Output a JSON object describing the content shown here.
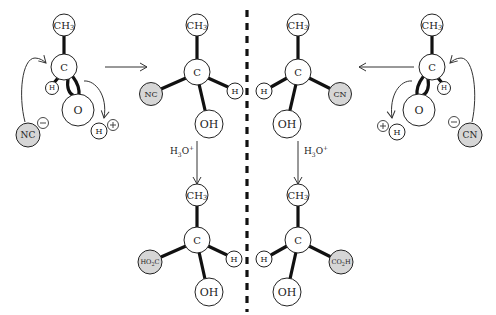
{
  "diagram": {
    "reagent_label": "H3O+",
    "reagent_base": "H",
    "reagent_sub": "3",
    "reagent_tail": "O",
    "reagent_sup": "+",
    "divider": "dashed vertical mirror line",
    "colors": {
      "nucleophile_fill": "#d6d6d6",
      "atom_fill": "#ffffff",
      "stroke": "#222222"
    },
    "left_start": {
      "methyl": "CH",
      "methyl_sub": "3",
      "carbon": "C",
      "hydrogen": "H",
      "oxygen": "O",
      "nucleophile": "NC",
      "nucleophile_charge": "−",
      "proton": "H",
      "proton_charge": "+"
    },
    "left_cyanohydrin": {
      "methyl": "CH",
      "methyl_sub": "3",
      "carbon": "C",
      "nitrile": "NC",
      "hydrogen": "H",
      "hydroxyl": "OH"
    },
    "left_product": {
      "methyl": "CH",
      "methyl_sub": "3",
      "carbon": "C",
      "acid": "HO",
      "acid_sub": "2",
      "acid_tail": "C",
      "hydrogen": "H",
      "hydroxyl": "OH"
    },
    "right_cyanohydrin": {
      "methyl": "CH",
      "methyl_sub": "3",
      "carbon": "C",
      "hydrogen": "H",
      "nitrile": "CN",
      "hydroxyl": "OH"
    },
    "right_product": {
      "methyl": "CH",
      "methyl_sub": "3",
      "carbon": "C",
      "hydrogen": "H",
      "acid": "CO",
      "acid_sub": "2",
      "acid_tail": "H",
      "hydroxyl": "OH"
    },
    "right_start": {
      "methyl": "CH",
      "methyl_sub": "3",
      "carbon": "C",
      "hydrogen": "H",
      "oxygen": "O",
      "nucleophile": "CN",
      "nucleophile_charge": "−",
      "proton": "H",
      "proton_charge": "+"
    }
  }
}
